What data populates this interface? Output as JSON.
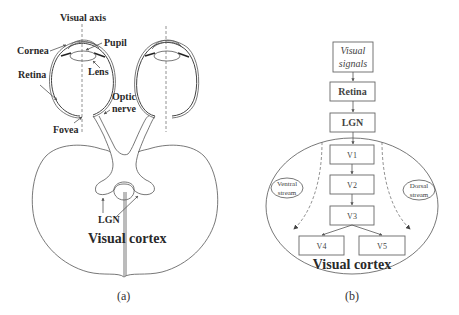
{
  "panel_a": {
    "caption": "(a)",
    "labels": {
      "visual_axis": "Visual axis",
      "cornea": "Cornea",
      "pupil": "Pupil",
      "lens": "Lens",
      "retina": "Retina",
      "optic": "Optic",
      "nerve": "nerve",
      "fovea": "Fovea",
      "lgn": "LGN",
      "visual_cortex": "Visual cortex"
    }
  },
  "panel_b": {
    "caption": "(b)",
    "flow": {
      "visual_signals_line1": "Visual",
      "visual_signals_line2": "signals",
      "retina": "Retina",
      "lgn": "LGN",
      "v1": "V1",
      "v2": "V2",
      "v3": "V3",
      "v4": "V4",
      "v5": "V5",
      "visual_cortex": "Visual cortex"
    },
    "streams": {
      "ventral_line1": "Ventral",
      "ventral_line2": "stream",
      "dorsal_line1": "Dorsal",
      "dorsal_line2": "stream"
    }
  },
  "colors": {
    "line": "#555555",
    "text": "#2a2a2a",
    "background": "#ffffff"
  }
}
